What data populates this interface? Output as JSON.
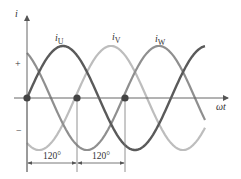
{
  "diagram": {
    "y_axis_label": "i",
    "x_axis_label": "ωt",
    "plus_sign": "+",
    "minus_sign": "−",
    "curves": [
      {
        "name": "iU",
        "label_base": "i",
        "label_sub": "U",
        "color": "#5a5a5a",
        "phase_deg": 0
      },
      {
        "name": "iV",
        "label_base": "i",
        "label_sub": "V",
        "color": "#bdbdbd",
        "phase_deg": -120
      },
      {
        "name": "iW",
        "label_base": "i",
        "label_sub": "W",
        "color": "#8f8f8f",
        "phase_deg": -240
      }
    ],
    "dimensions": [
      {
        "label": "120°"
      },
      {
        "label": "120°"
      }
    ]
  }
}
